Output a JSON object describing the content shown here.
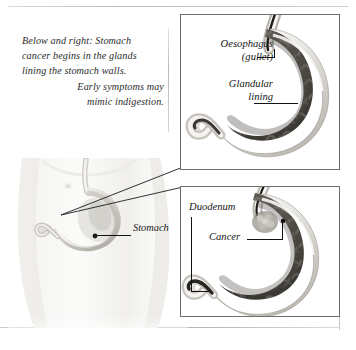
{
  "figure": {
    "caption_lines": [
      "Below and right: Stomach",
      "cancer begins in the glands",
      "lining the stomach walls.",
      "Early symptoms may",
      "mimic indigestion."
    ]
  },
  "torso": {
    "label_stomach": "Stomach"
  },
  "panel_top": {
    "label_oesophagus_line1": "Oesophagus",
    "label_oesophagus_line2": "(gullet)",
    "label_glandular_line1": "Glandular",
    "label_glandular_line2": "lining"
  },
  "panel_bottom": {
    "label_duodenum": "Duodenum",
    "label_cancer": "Cancer"
  },
  "colors": {
    "page_background": "#ffffff",
    "panel_border": "#6e6e6e",
    "text": "#1a1a1a",
    "leader_line": "#111111",
    "stomach_wall_light": "#f2f1ee",
    "stomach_wall_mid": "#cfccc6",
    "stomach_lumen_dark": "#4e4b47",
    "stomach_lumen_deep": "#343230",
    "rugae": "#6d6a65",
    "cancer_lesion": "#b9b5ad",
    "torso_skin": "#f2f1ef",
    "torso_shadow": "#dcdad6",
    "rule": "#c4c4c4"
  }
}
